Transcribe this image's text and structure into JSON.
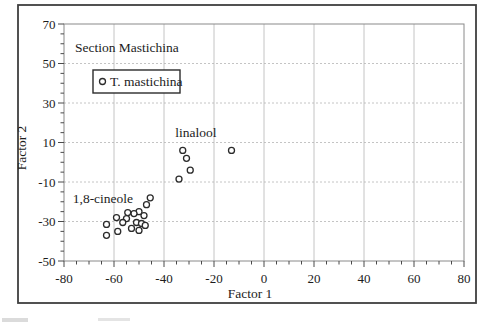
{
  "chart_data": {
    "type": "scatter",
    "title": "Section Mastichina",
    "xlabel": "Factor 1",
    "ylabel": "Factor 2",
    "xlim": [
      -80,
      80
    ],
    "ylim": [
      -50,
      70
    ],
    "x_ticks": [
      -80,
      -60,
      -40,
      -20,
      0,
      20,
      40,
      60,
      80
    ],
    "y_ticks": [
      70,
      50,
      30,
      10,
      -10,
      -30,
      -50
    ],
    "minor_tick_step": 5,
    "grid": {
      "vertical": "solid",
      "horizontal": "dashed"
    },
    "legend": {
      "label": "T. mastichina",
      "marker": "open-circle",
      "position": "top-left"
    },
    "series": [
      {
        "name": "T. mastichina",
        "marker": "open-circle",
        "points": [
          [
            -32.5,
            6
          ],
          [
            -31,
            2
          ],
          [
            -29.5,
            -4
          ],
          [
            -34,
            -8.5
          ],
          [
            -13,
            6
          ],
          [
            -45.5,
            -18
          ],
          [
            -47,
            -21.5
          ],
          [
            -50,
            -25
          ],
          [
            -52,
            -26
          ],
          [
            -54.5,
            -25.5
          ],
          [
            -48,
            -27
          ],
          [
            -55,
            -28.5
          ],
          [
            -59,
            -28
          ],
          [
            -56.5,
            -30.5
          ],
          [
            -51,
            -30.5
          ],
          [
            -49,
            -31
          ],
          [
            -47.5,
            -32
          ],
          [
            -63,
            -31.5
          ],
          [
            -53,
            -33.5
          ],
          [
            -50,
            -34.5
          ],
          [
            -58.5,
            -35
          ],
          [
            -63,
            -37
          ]
        ]
      }
    ],
    "annotations": [
      {
        "text": "linalool",
        "x": -35.5,
        "y": 13
      },
      {
        "text": "1,8-cineole",
        "x": -76.5,
        "y": -20.5
      }
    ],
    "colors": {
      "text": "#1c1c1c",
      "marker_stroke": "#2b2b2b",
      "grid": "#b5b5b5",
      "plot_frame": "#8a8a8a",
      "outer_border": "#3f3f3f",
      "background": "#ffffff"
    }
  }
}
